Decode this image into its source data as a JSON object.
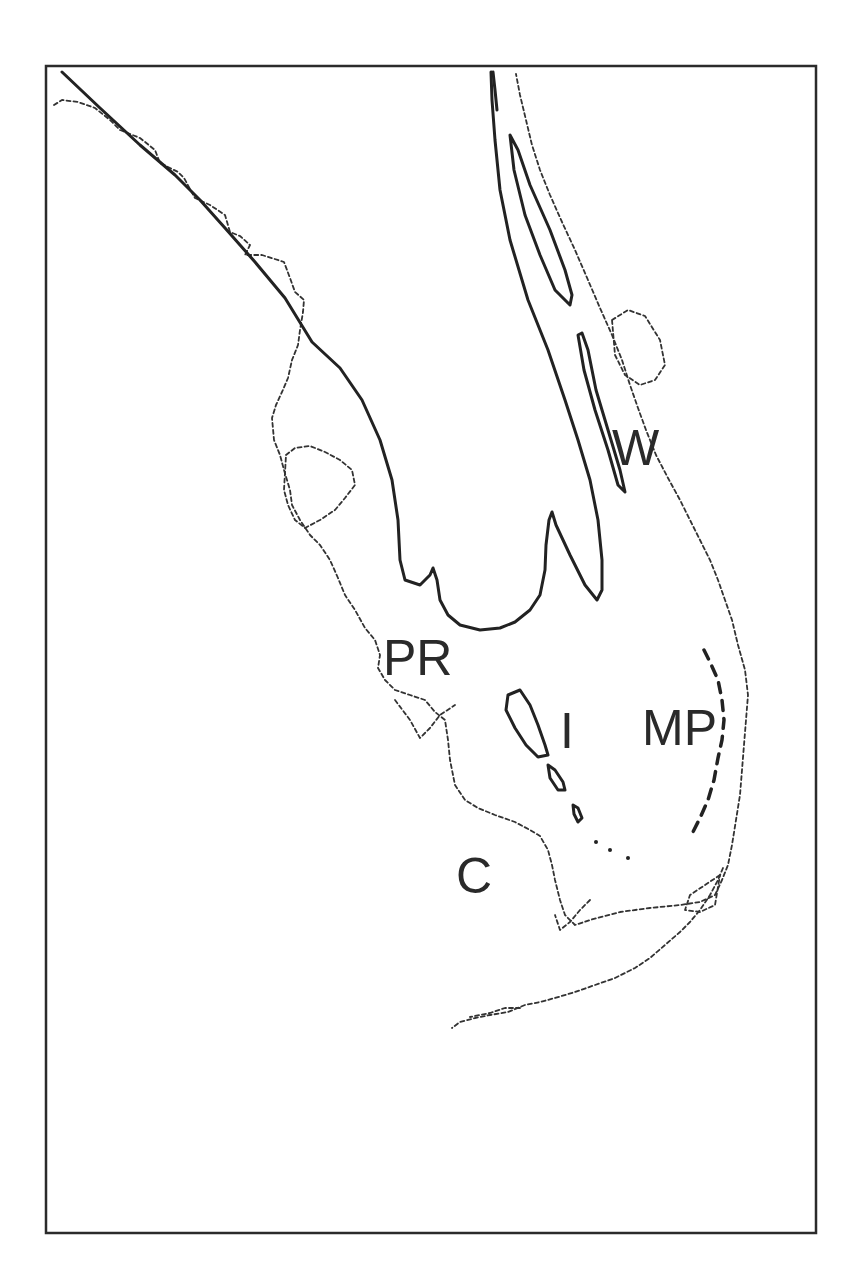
{
  "map": {
    "title": "",
    "region": "South Florida",
    "labels": [
      {
        "id": "W",
        "text": "W",
        "x": 612,
        "y": 465
      },
      {
        "id": "PR",
        "text": "PR",
        "x": 383,
        "y": 675
      },
      {
        "id": "I",
        "text": "I",
        "x": 560,
        "y": 748
      },
      {
        "id": "MP",
        "text": "MP",
        "x": 642,
        "y": 745
      },
      {
        "id": "C",
        "text": "C",
        "x": 456,
        "y": 893
      }
    ],
    "legend": {
      "coastline_style": "dashed",
      "contour_style": "solid"
    },
    "colors": {
      "line": "#222222",
      "background": "#ffffff"
    }
  }
}
